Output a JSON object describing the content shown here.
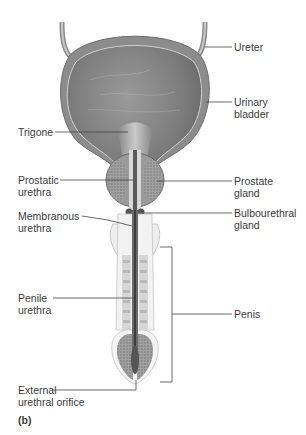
{
  "figure": {
    "panel_label": "(b)",
    "labels": {
      "ureter": "Ureter",
      "urinary_bladder": "Urinary\nbladder",
      "trigone": "Trigone",
      "prostatic_urethra": "Prostatic\nurethra",
      "prostate_gland": "Prostate\ngland",
      "membranous_urethra": "Membranous\nurethra",
      "bulbourethral_gland": "Bulbourethral\ngland",
      "penile_urethra": "Penile\nurethra",
      "penis": "Penis",
      "external_urethral_orifice": "External\nurethral orifice"
    },
    "colors": {
      "tissue_dark": "#7a7a7a",
      "tissue_mid": "#a8a8a8",
      "tissue_light": "#dcdcdc",
      "leader_line": "#444444"
    }
  }
}
